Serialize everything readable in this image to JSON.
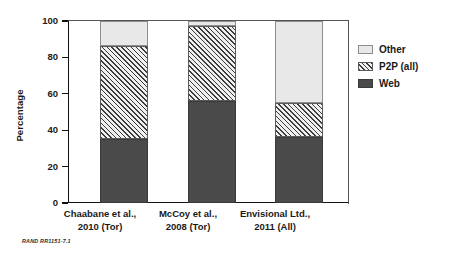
{
  "figure": {
    "footer_note": "RAND RR1151-7.1"
  },
  "axes": {
    "y_title": "Percentage",
    "y_ticks": [
      "0",
      "20",
      "40",
      "60",
      "80",
      "100"
    ]
  },
  "legend": {
    "items": [
      {
        "label": "Other",
        "swatch": "light-gray-swatch"
      },
      {
        "label": "P2P (all)",
        "swatch": "hatched-swatch"
      },
      {
        "label": "Web",
        "swatch": "dark-gray-swatch"
      }
    ]
  },
  "categories": [
    {
      "line1": "Chaabane et al.,",
      "line2": "2010 (Tor)"
    },
    {
      "line1": "McCoy et al.,",
      "line2": "2008 (Tor)"
    },
    {
      "line1": "Envisional Ltd.,",
      "line2": "2011 (All)"
    }
  ],
  "chart_data": {
    "type": "bar",
    "title": "",
    "xlabel": "",
    "ylabel": "Percentage",
    "ylim": [
      0,
      100
    ],
    "grid": false,
    "stacked": true,
    "legend_position": "right-top",
    "categories": [
      "Chaabane et al., 2010 (Tor)",
      "McCoy et al., 2008 (Tor)",
      "Envisional Ltd., 2011 (All)"
    ],
    "series": [
      {
        "name": "Web",
        "color": "#4a4a4a",
        "values": [
          35,
          56,
          36
        ]
      },
      {
        "name": "P2P (all)",
        "color": "#efefef",
        "pattern": "diagonal-hatch",
        "values": [
          51,
          41,
          19
        ]
      },
      {
        "name": "Other",
        "color": "#e8e8e8",
        "values": [
          14,
          3,
          45
        ]
      }
    ],
    "cumulative_tops": {
      "Web": [
        35,
        56,
        36
      ],
      "P2P (all)": [
        86,
        97,
        55
      ],
      "Other": [
        100,
        100,
        100
      ]
    },
    "yticks": [
      0,
      20,
      40,
      60,
      80,
      100
    ]
  }
}
